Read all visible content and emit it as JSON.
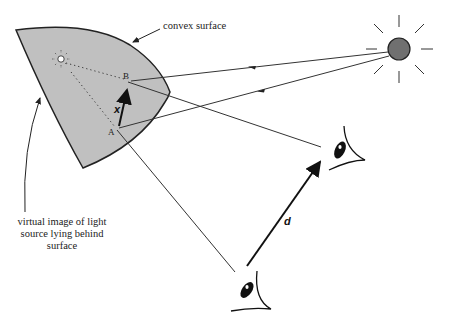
{
  "labels": {
    "surface": "convex surface",
    "virtual_line1": "virtual image of light",
    "virtual_line2": "source lying behind",
    "virtual_line3": "surface",
    "point_a": "A",
    "point_b": "B",
    "vector_x": "x",
    "vector_d": "d"
  },
  "colors": {
    "surface_fill": "#c0c0c0",
    "light_source_fill": "#707070",
    "stroke": "#222222"
  }
}
